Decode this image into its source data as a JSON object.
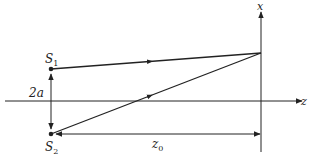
{
  "diagram": {
    "colors": {
      "stroke": "#222222",
      "background": "#ffffff"
    },
    "labels": {
      "x_axis": "x",
      "z_axis": "z",
      "source1": "S",
      "source1_sub": "1",
      "source2": "S",
      "source2_sub": "2",
      "separation": "2a",
      "distance": "z",
      "distance_sub": "0"
    },
    "points": {
      "S1": [
        51,
        69
      ],
      "S2": [
        51,
        134
      ],
      "screen_point": [
        261,
        53
      ]
    }
  }
}
